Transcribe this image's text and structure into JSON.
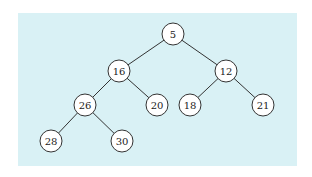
{
  "diagram": {
    "type": "binary-tree",
    "background_color": "#d9f1f5",
    "node_fill": "#ffffff",
    "stroke_color": "#333333",
    "node_radius": 11,
    "nodes": [
      {
        "id": "n5",
        "label": "5",
        "x": 173,
        "y": 34
      },
      {
        "id": "n16",
        "label": "16",
        "x": 119,
        "y": 71
      },
      {
        "id": "n12",
        "label": "12",
        "x": 226,
        "y": 71
      },
      {
        "id": "n26",
        "label": "26",
        "x": 85,
        "y": 105
      },
      {
        "id": "n20",
        "label": "20",
        "x": 157,
        "y": 105
      },
      {
        "id": "n18",
        "label": "18",
        "x": 190,
        "y": 105
      },
      {
        "id": "n21",
        "label": "21",
        "x": 263,
        "y": 105
      },
      {
        "id": "n28",
        "label": "28",
        "x": 51,
        "y": 141
      },
      {
        "id": "n30",
        "label": "30",
        "x": 122,
        "y": 141
      }
    ],
    "edges": [
      {
        "from": "n5",
        "to": "n16"
      },
      {
        "from": "n5",
        "to": "n12"
      },
      {
        "from": "n16",
        "to": "n26"
      },
      {
        "from": "n16",
        "to": "n20"
      },
      {
        "from": "n12",
        "to": "n18"
      },
      {
        "from": "n12",
        "to": "n21"
      },
      {
        "from": "n26",
        "to": "n28"
      },
      {
        "from": "n26",
        "to": "n30"
      }
    ]
  }
}
